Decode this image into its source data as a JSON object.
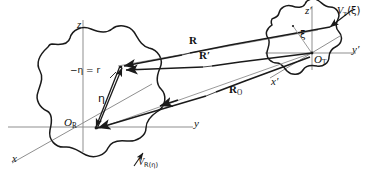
{
  "figure": {
    "background_color": "#ffffff",
    "line_color": "#1a1a1a",
    "thin_line_color": "#8a8a8a",
    "width": 375,
    "height": 177
  },
  "reference_frame": {
    "origin_label": "O",
    "origin_subscript": "R",
    "axis_x": "x",
    "axis_y": "y",
    "axis_z": "z",
    "volume_label": "V",
    "volume_subscript": "R(η)",
    "local_vector": "η",
    "relation_label": "−η = r"
  },
  "target_frame": {
    "origin_label": "O",
    "origin_subscript": "T",
    "axis_x": "x′",
    "axis_y": "y′",
    "axis_z": "z′",
    "volume_label": "V",
    "volume_subscript": "T",
    "volume_argument": "(ξ)",
    "local_vector": "ξ"
  },
  "vectors": {
    "R": "R",
    "R_prime": "R′",
    "R_O": "R",
    "R_O_subscript": "O"
  }
}
